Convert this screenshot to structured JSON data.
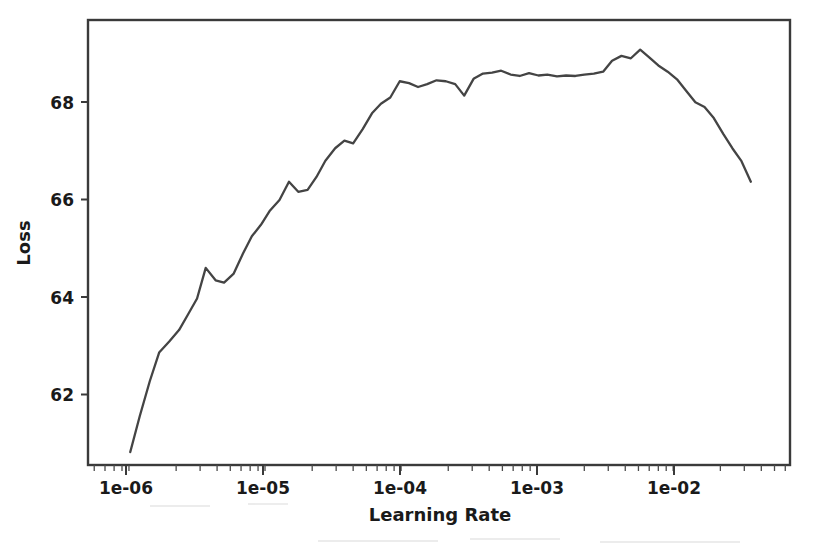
{
  "chart_data": {
    "type": "line",
    "title": "",
    "xlabel": "Learning Rate",
    "ylabel": "Loss",
    "xscale": "log",
    "yscale": "linear",
    "xlim": [
      4.5e-07,
      0.065
    ],
    "ylim": [
      60.6,
      69.9
    ],
    "grid": false,
    "legend": null,
    "xticks": [
      1e-06,
      1e-05,
      0.0001,
      0.001,
      0.01
    ],
    "xticklabels": [
      "1e-06",
      "1e-05",
      "1e-04",
      "1e-03",
      "1e-02"
    ],
    "yticks": [
      62,
      64,
      66,
      68
    ],
    "yticklabels": [
      "62",
      "64",
      "66",
      "68"
    ],
    "series": [
      {
        "name": "loss",
        "color": "#444444",
        "x": [
          9.2e-07,
          1.08e-06,
          1.28e-06,
          1.5e-06,
          1.78e-06,
          2.1e-06,
          2.45e-06,
          2.85e-06,
          3.3e-06,
          3.9e-06,
          4.5e-06,
          5.3e-06,
          6.2e-06,
          7.2e-06,
          8.4e-06,
          9.8e-06,
          1.15e-05,
          1.35e-05,
          1.58e-05,
          1.85e-05,
          2.15e-05,
          2.5e-05,
          2.95e-05,
          3.45e-05,
          4e-05,
          4.7e-05,
          5.5e-05,
          6.4e-05,
          7.5e-05,
          8.8e-05,
          0.000103,
          0.00012,
          0.00014,
          0.000164,
          0.000192,
          0.000225,
          0.000262,
          0.000307,
          0.00036,
          0.00042,
          0.00049,
          0.000575,
          0.00067,
          0.000785,
          0.00092,
          0.00107,
          0.00126,
          0.00147,
          0.00172,
          0.002,
          0.00235,
          0.00275,
          0.0032,
          0.00375,
          0.0044,
          0.00515,
          0.006,
          0.007,
          0.0082,
          0.0096,
          0.0112,
          0.0131,
          0.0153,
          0.0179,
          0.021,
          0.0245,
          0.0286,
          0.0335
        ],
        "y": [
          60.87,
          61.62,
          62.35,
          62.95,
          63.18,
          63.42,
          63.75,
          64.08,
          64.72,
          64.46,
          64.41,
          64.6,
          65.02,
          65.38,
          65.62,
          65.92,
          66.14,
          66.52,
          66.31,
          66.35,
          66.62,
          66.96,
          67.22,
          67.38,
          67.32,
          67.62,
          67.95,
          68.15,
          68.28,
          68.62,
          68.58,
          68.5,
          68.56,
          68.64,
          68.62,
          68.56,
          68.32,
          68.67,
          68.78,
          68.8,
          68.84,
          68.76,
          68.73,
          68.79,
          68.74,
          68.76,
          68.72,
          68.74,
          68.73,
          68.76,
          68.78,
          68.82,
          69.05,
          69.15,
          69.1,
          69.28,
          69.12,
          68.95,
          68.82,
          68.66,
          68.42,
          68.18,
          68.08,
          67.85,
          67.52,
          67.22,
          66.95,
          66.52
        ]
      }
    ]
  },
  "axis": {
    "x_title": "Learning Rate",
    "y_title": "Loss",
    "x_tick_labels": [
      "1e-06",
      "1e-05",
      "1e-04",
      "1e-03",
      "1e-02"
    ],
    "y_tick_labels": [
      "68",
      "66",
      "64",
      "62"
    ]
  }
}
